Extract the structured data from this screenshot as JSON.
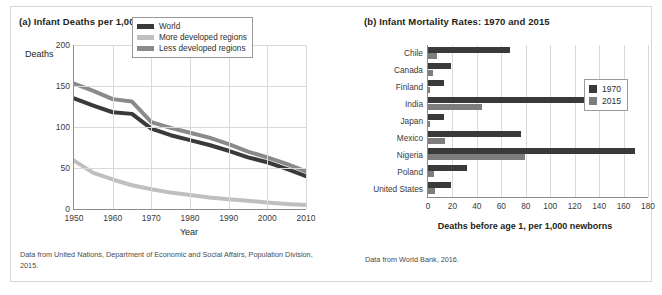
{
  "figure": {
    "panel_a": {
      "title": "(a) Infant Deaths per 1,000 Births",
      "source": "Data from United Nations, Department of Economic and Social Affairs, Population Division, 2015."
    },
    "panel_b": {
      "title": "(b) Infant Mortality Rates: 1970 and 2015",
      "source": "Data from World Bank, 2016."
    }
  },
  "colors": {
    "world": "#3a3a3a",
    "more_developed": "#bfbfbf",
    "less_developed": "#8a8a8a",
    "y1970": "#3a3a3a",
    "y2015": "#7d7d7d",
    "grid": "#d9d9d9",
    "axis": "#8c8c8c",
    "border": "#d8d8d8"
  },
  "chart_data": [
    {
      "type": "line",
      "title": "(a) Infant Deaths per 1,000 Births",
      "xlabel": "Year",
      "ylabel": "Deaths",
      "xlim": [
        1950,
        2010
      ],
      "ylim": [
        0,
        200
      ],
      "xticks": [
        1950,
        1960,
        1970,
        1980,
        1990,
        2000,
        2010
      ],
      "yticks": [
        0,
        50,
        100,
        150,
        200
      ],
      "grid": true,
      "legend_position": "top-right",
      "x": [
        1950,
        1955,
        1960,
        1965,
        1970,
        1975,
        1980,
        1985,
        1990,
        1995,
        2000,
        2005,
        2010
      ],
      "series": [
        {
          "name": "World",
          "color": "#3a3a3a",
          "values": [
            135,
            126,
            118,
            116,
            98,
            90,
            84,
            78,
            71,
            63,
            57,
            49,
            40
          ]
        },
        {
          "name": "More developed regions",
          "color": "#bfbfbf",
          "values": [
            59,
            44,
            36,
            29,
            24,
            20,
            17,
            14,
            12,
            10,
            8,
            6,
            5
          ]
        },
        {
          "name": "Less developed regions",
          "color": "#8a8a8a",
          "values": [
            153,
            144,
            134,
            131,
            106,
            99,
            93,
            87,
            79,
            70,
            63,
            55,
            46
          ]
        }
      ]
    },
    {
      "type": "bar",
      "orientation": "horizontal",
      "title": "(b) Infant Mortality Rates: 1970 and 2015",
      "xlabel": "Deaths before age 1, per 1,000 newborns",
      "ylabel": "",
      "xlim": [
        0,
        180
      ],
      "xticks": [
        0,
        20,
        40,
        60,
        80,
        100,
        120,
        140,
        160,
        180
      ],
      "grid": true,
      "legend_position": "right",
      "categories": [
        "Chile",
        "Canada",
        "Finland",
        "India",
        "Japan",
        "Mexico",
        "Nigeria",
        "Poland",
        "United States"
      ],
      "series": [
        {
          "name": "1970",
          "color": "#3a3a3a",
          "values": [
            67,
            19,
            13,
            142,
            13,
            76,
            169,
            32,
            19
          ]
        },
        {
          "name": "2015",
          "color": "#7d7d7d",
          "values": [
            7,
            4,
            2,
            44,
            2,
            14,
            79,
            5,
            6
          ]
        }
      ]
    }
  ]
}
